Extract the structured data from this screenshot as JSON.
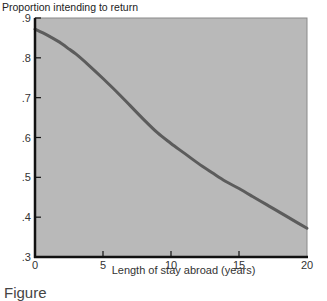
{
  "caption": "Figure",
  "chart_data": {
    "type": "line",
    "title": "",
    "ylabel": "Proportion intending to return",
    "xlabel": "Length of stay abroad (years)",
    "xlim": [
      0,
      20
    ],
    "ylim": [
      0.3,
      0.9
    ],
    "xticks": [
      0,
      5,
      10,
      15,
      20
    ],
    "xtick_labels": [
      "0",
      "5",
      "10",
      "15",
      "20"
    ],
    "yticks": [
      0.3,
      0.4,
      0.5,
      0.6,
      0.7,
      0.8,
      0.9
    ],
    "ytick_labels": [
      ".3",
      ".4",
      ".5",
      ".6",
      ".7",
      ".8",
      ".9"
    ],
    "grid": false,
    "legend": null,
    "series": [
      {
        "name": "Proportion intending to return",
        "x": [
          0,
          1,
          2,
          2.5,
          3,
          4,
          5,
          6,
          7,
          8,
          9,
          10,
          11,
          12,
          13,
          14,
          15,
          16,
          17,
          18,
          19,
          20
        ],
        "values": [
          0.872,
          0.855,
          0.835,
          0.822,
          0.81,
          0.78,
          0.748,
          0.715,
          0.68,
          0.645,
          0.612,
          0.585,
          0.56,
          0.535,
          0.512,
          0.49,
          0.472,
          0.452,
          0.432,
          0.412,
          0.392,
          0.372
        ]
      }
    ],
    "colors": {
      "plot_background": "#b9b9b9",
      "line": "#5c5c5c",
      "axis": "#111111"
    }
  }
}
